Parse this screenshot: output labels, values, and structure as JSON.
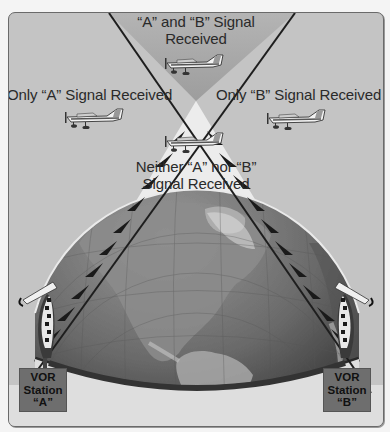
{
  "figure": {
    "regions": {
      "both": {
        "line1": "“A” and “B” Signal",
        "line2": "Received"
      },
      "only_a": {
        "label": "Only “A” Signal Received"
      },
      "only_b": {
        "label": "Only “B” Signal Received"
      },
      "neither": {
        "line1": "Neither “A” nor “B”",
        "line2": "Signal Received"
      }
    },
    "stations": [
      {
        "line1": "VOR",
        "line2": "Station",
        "line3": "“A”"
      },
      {
        "line1": "VOR",
        "line2": "Station",
        "line3": "“B”"
      }
    ],
    "icons": {
      "aircraft": "airplane-icon",
      "station_antenna": "vor-antenna-icon",
      "globe": "globe-icon"
    },
    "colors": {
      "background": "#c4c4c4",
      "top_wedge": "#a9a9a9",
      "bottom_wedge": "#ececec",
      "globe_dark": "#3c3c3c",
      "globe_light": "#8a8a8a",
      "signal_lines": "#1e1e1e",
      "station_box": "#6e6e6e"
    }
  }
}
